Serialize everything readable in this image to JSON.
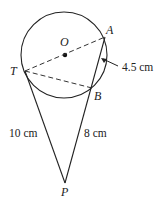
{
  "diagram": {
    "type": "geometry",
    "circle": {
      "center_label": "O",
      "cx": 64,
      "cy": 55,
      "r": 43
    },
    "points": {
      "O": {
        "label": "O",
        "x": 65,
        "y": 54
      },
      "A": {
        "label": "A",
        "x": 105,
        "y": 37
      },
      "T": {
        "label": "T",
        "x": 25,
        "y": 71
      },
      "B": {
        "label": "B",
        "x": 92,
        "y": 88
      },
      "P": {
        "label": "P",
        "x": 65,
        "y": 183
      }
    },
    "segments": [
      {
        "from": "T",
        "to": "A",
        "style": "dashed"
      },
      {
        "from": "T",
        "to": "B",
        "style": "dashed"
      },
      {
        "from": "T",
        "to": "P",
        "style": "solid"
      },
      {
        "from": "A",
        "to": "P",
        "style": "solid"
      }
    ],
    "measurements": {
      "AB": "4.5 cm",
      "TP": "10 cm",
      "BP": "8 cm"
    },
    "colors": {
      "line": "#222222",
      "background": "#ffffff"
    }
  }
}
